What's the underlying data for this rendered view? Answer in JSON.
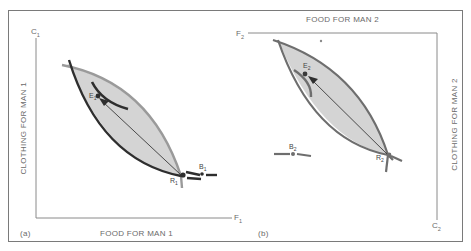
{
  "panels": {
    "a": {
      "tag": "(a)",
      "x_axis_label": "FOOD FOR MAN 1",
      "y_axis_label": "CLOTHING FOR MAN 1",
      "x_axis_symbol": "F",
      "x_axis_sub": "1",
      "y_axis_symbol": "C",
      "y_axis_sub": "1",
      "points": [
        {
          "name": "E",
          "sub": "1"
        },
        {
          "name": "R",
          "sub": "1"
        },
        {
          "name": "B",
          "sub": "1"
        }
      ]
    },
    "b": {
      "tag": "(b)",
      "x_axis_label": "FOOD FOR MAN 2",
      "y_axis_label": "CLOTHING FOR MAN 2",
      "x_axis_symbol": "F",
      "x_axis_sub": "2",
      "y_axis_symbol": "C",
      "y_axis_sub": "2",
      "points": [
        {
          "name": "E",
          "sub": "2"
        },
        {
          "name": "R",
          "sub": "2"
        },
        {
          "name": "B",
          "sub": "2"
        }
      ]
    }
  },
  "colors": {
    "lens_fill": "#d4d4d4",
    "dark_curve": "#2e2e2e",
    "light_curve": "#9a9a9a",
    "mid_curve": "#6e6e6e",
    "axis": "#8a8a8a",
    "frame": "#7a7a7a"
  }
}
